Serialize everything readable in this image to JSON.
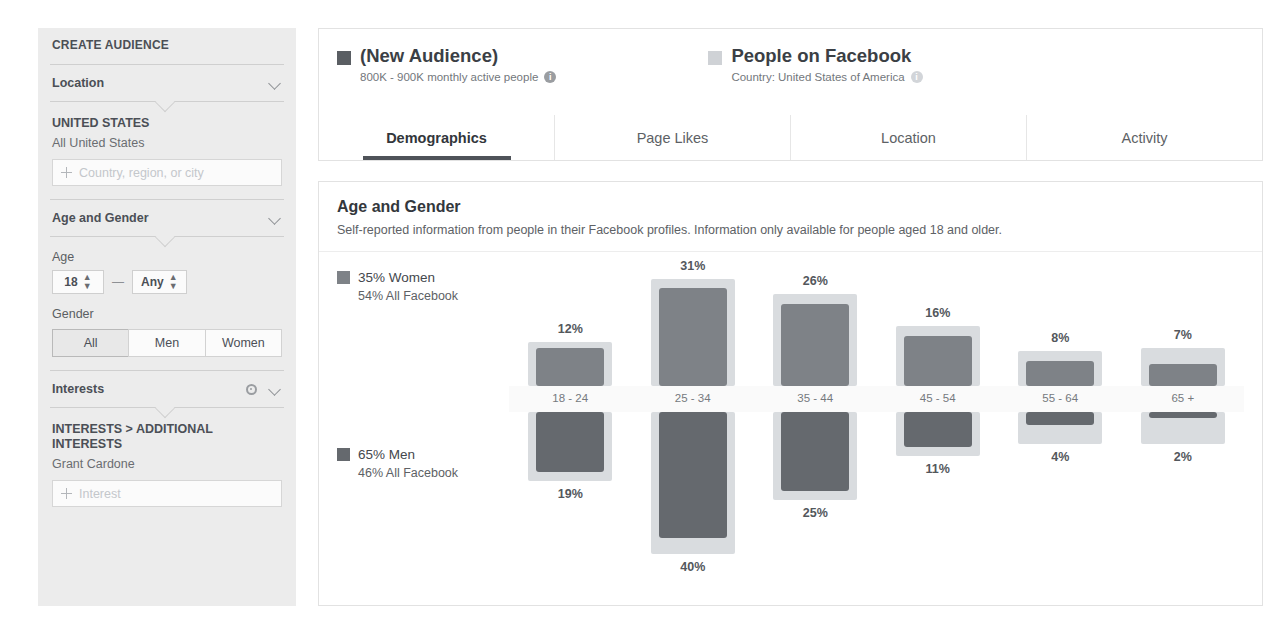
{
  "sidebar": {
    "title": "CREATE AUDIENCE",
    "sections": [
      {
        "label": "Location",
        "chevron": "chevron-down-icon"
      },
      {
        "label": "Age and Gender",
        "chevron": "chevron-down-icon"
      },
      {
        "label": "Interests",
        "gear": "gear-icon",
        "chevron": "chevron-down-icon"
      }
    ],
    "location": {
      "heading": "UNITED STATES",
      "value": "All United States",
      "input_placeholder": "Country, region, or city",
      "add_icon": "plus-icon"
    },
    "age": {
      "label": "Age",
      "min": "18",
      "max": "Any",
      "separator": "—",
      "stepper_icon": "stepper-icon"
    },
    "gender": {
      "label": "Gender",
      "options": [
        "All",
        "Men",
        "Women"
      ],
      "selected": "All"
    },
    "interests": {
      "heading": "INTERESTS > ADDITIONAL INTERESTS",
      "value": "Grant Cardone",
      "input_placeholder": "Interest",
      "add_icon": "plus-icon"
    }
  },
  "header": {
    "audience": {
      "swatch": "legend-swatch-dark",
      "title": "(New Audience)",
      "subtitle": "800K - 900K monthly active people",
      "info_icon": "info-icon"
    },
    "comparison": {
      "swatch": "legend-swatch-light",
      "title": "People on Facebook",
      "subtitle": "Country: United States of America",
      "info_icon": "info-icon"
    }
  },
  "tabs": [
    {
      "label": "Demographics",
      "active": true
    },
    {
      "label": "Page Likes",
      "active": false
    },
    {
      "label": "Location",
      "active": false
    },
    {
      "label": "Activity",
      "active": false
    }
  ],
  "section": {
    "title": "Age and Gender",
    "description": "Self-reported information from people in their Facebook profiles. Information only available for people aged 18 and older."
  },
  "chart_legend": {
    "women": {
      "primary": "35% Women",
      "secondary": "54% All Facebook",
      "swatch": "#7e8287"
    },
    "men": {
      "primary": "65% Men",
      "secondary": "46% All Facebook",
      "swatch": "#65696e"
    }
  },
  "chart_data": {
    "type": "bar",
    "title": "Age and Gender",
    "xlabel": "",
    "ylabel": "",
    "grid": false,
    "legend_position": "left",
    "orientation": "diverging-vertical",
    "categories": [
      "18 - 24",
      "25 - 34",
      "35 - 44",
      "45 - 54",
      "55 - 64",
      "65 +"
    ],
    "series": [
      {
        "name": "35% Women",
        "direction": "up",
        "color": "#7e8287",
        "values": [
          12,
          31,
          26,
          16,
          8,
          7
        ],
        "labels": [
          "12%",
          "31%",
          "26%",
          "16%",
          "8%",
          "7%"
        ]
      },
      {
        "name": "65% Men",
        "direction": "down",
        "color": "#65696e",
        "values": [
          19,
          40,
          25,
          11,
          4,
          2
        ],
        "labels": [
          "19%",
          "40%",
          "25%",
          "11%",
          "4%",
          "2%"
        ]
      },
      {
        "name": "All Facebook Women",
        "direction": "up",
        "color": "#d9dcdf",
        "values": [
          14,
          34,
          29,
          19,
          11,
          12
        ],
        "labels": []
      },
      {
        "name": "All Facebook Men",
        "direction": "down",
        "color": "#d9dcdf",
        "values": [
          22,
          45,
          28,
          14,
          10,
          10
        ],
        "labels": []
      }
    ],
    "ylim": [
      0,
      45
    ]
  }
}
